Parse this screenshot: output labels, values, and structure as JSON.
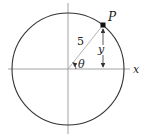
{
  "diagram": {
    "labels": {
      "point": "P",
      "radius": "5",
      "height": "y",
      "angle": "θ",
      "x_axis": "x"
    },
    "geometry": {
      "center": [
        68,
        69
      ],
      "radius_px": 56,
      "point_P": [
        103,
        25
      ],
      "radius_value": 5
    },
    "colors": {
      "circle": "#333333",
      "axes": "#888888",
      "radius_line": "#999999",
      "point": "#111111"
    }
  }
}
